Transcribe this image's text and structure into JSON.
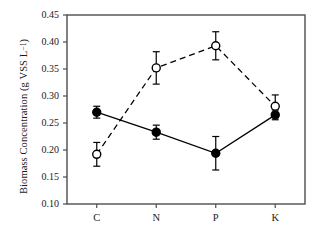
{
  "chart_data": {
    "type": "line",
    "title": "",
    "xlabel": "",
    "ylabel": "Biomass Concentration (g VSS L⁻¹)",
    "ylabel_text": "Biomass Concentration (g VSS L",
    "ylabel_sup": "−1",
    "ylabel_tail": ")",
    "categories": [
      "C",
      "N",
      "P",
      "K"
    ],
    "ylim": [
      0.1,
      0.45
    ],
    "yticks": [
      0.1,
      0.15,
      0.2,
      0.25,
      0.3,
      0.35,
      0.4,
      0.45
    ],
    "ytick_labels": [
      "0.10",
      "0.15",
      "0.20",
      "0.25",
      "0.30",
      "0.35",
      "0.40",
      "0.45"
    ],
    "grid": false,
    "legend": "none",
    "series": [
      {
        "name": "filled-circle-series",
        "marker": "filled-circle",
        "line_style": "solid",
        "color": "#000000",
        "values": [
          0.27,
          0.233,
          0.194,
          0.265
        ],
        "errors": [
          0.011,
          0.013,
          0.031,
          0.009
        ]
      },
      {
        "name": "open-circle-series",
        "marker": "open-circle",
        "line_style": "dashed",
        "color": "#000000",
        "values": [
          0.192,
          0.352,
          0.393,
          0.281
        ],
        "errors": [
          0.022,
          0.03,
          0.026,
          0.021
        ]
      }
    ]
  },
  "figure": {
    "background_color": "#ffffff",
    "axis_color": "#4d4d4d",
    "marker_color": "#000000"
  }
}
